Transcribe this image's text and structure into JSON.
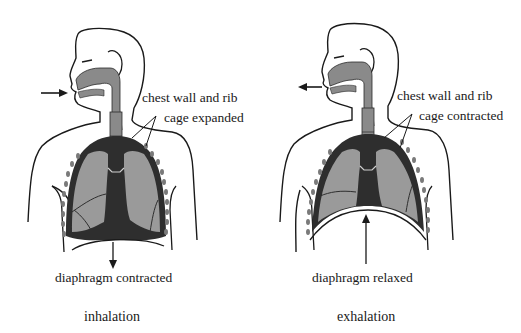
{
  "figures": [
    {
      "id": "inhalation",
      "caption": "inhalation",
      "chest_label_line1": "chest wall and rib",
      "chest_label_line2": "cage expanded",
      "diaphragm_label": "diaphragm contracted",
      "airflow_direction": "in"
    },
    {
      "id": "exhalation",
      "caption": "exhalation",
      "chest_label_line1": "chest wall and rib",
      "chest_label_line2": "cage contracted",
      "diaphragm_label": "diaphragm relaxed",
      "airflow_direction": "out"
    }
  ],
  "colors": {
    "airway": "#8a8a8a",
    "lung": "#9a9a9a",
    "pleura": "#2e2e2e",
    "outline": "#1a1a1a",
    "rib": "#7a7a7a",
    "background": "#ffffff"
  }
}
